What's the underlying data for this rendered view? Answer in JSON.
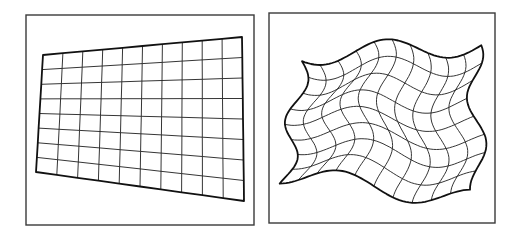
{
  "figure": {
    "width": 522,
    "height": 238,
    "stroke_color": "#1e1e1e",
    "frame_color": "#3a3a3a",
    "panels": [
      {
        "name": "perspective-grid-panel",
        "label": "Projective (keystone) warp of a regular grid",
        "frame": {
          "x": 26,
          "y": 15,
          "w": 228,
          "h": 210
        },
        "grid": {
          "columns": 10,
          "rows": 8,
          "corners": {
            "top_left": [
              43,
              55
            ],
            "top_right": [
              242,
              37
            ],
            "bottom_right": [
              244,
              201
            ],
            "bottom_left": [
              36,
              172
            ]
          }
        }
      },
      {
        "name": "nonlinear-warp-panel",
        "label": "Non-linear (wavy) warp of a regular grid",
        "frame": {
          "x": 269,
          "y": 13,
          "w": 226,
          "h": 210
        },
        "grid": {
          "columns": 10,
          "rows": 8,
          "corners": {
            "top_left": [
              302,
              55
            ],
            "top_right": [
              474,
              45
            ],
            "bottom_right": [
              479,
              200
            ],
            "bottom_left": [
              285,
              173
            ]
          },
          "wave": {
            "x_amp": 9,
            "y_amp": 11,
            "x_freq": 1.6,
            "y_freq": 1.4
          }
        }
      }
    ]
  }
}
